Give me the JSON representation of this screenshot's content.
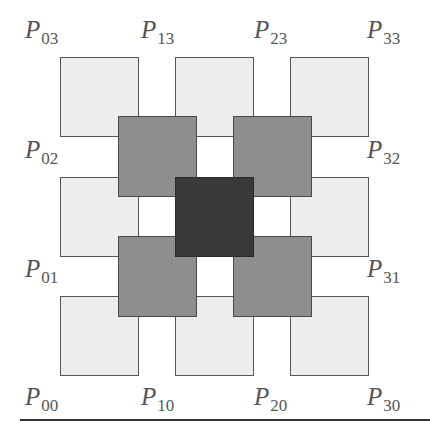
{
  "diagram": {
    "title": "",
    "grid_size": "4x4",
    "colors": {
      "light": "#ededed",
      "medium": "#8e8e8e",
      "dark": "#3a3a3a",
      "outline": "#555555",
      "label": "#555555"
    },
    "labels": [
      {
        "name": "P",
        "sub": "03"
      },
      {
        "name": "P",
        "sub": "13"
      },
      {
        "name": "P",
        "sub": "23"
      },
      {
        "name": "P",
        "sub": "33"
      },
      {
        "name": "P",
        "sub": "02"
      },
      {
        "name": "P",
        "sub": "32"
      },
      {
        "name": "P",
        "sub": "01"
      },
      {
        "name": "P",
        "sub": "31"
      },
      {
        "name": "P",
        "sub": "00"
      },
      {
        "name": "P",
        "sub": "10"
      },
      {
        "name": "P",
        "sub": "20"
      },
      {
        "name": "P",
        "sub": "30"
      }
    ],
    "squares": {
      "light_count": 9,
      "medium_count": 4,
      "dark_count": 1
    }
  }
}
